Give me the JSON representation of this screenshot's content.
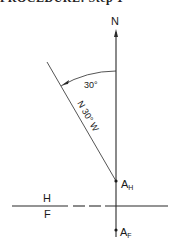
{
  "caption": "PROCEDURE: Step 1",
  "diagram": {
    "north_label": "N",
    "angle_label": "30°",
    "bearing_label": "N 30° W",
    "plane_top": "H",
    "plane_bottom": "F",
    "point_h_main": "A",
    "point_h_sub": "H",
    "point_f_main": "A",
    "point_f_sub": "F",
    "line_color": "#2a2a2a",
    "angle_deg": 30
  }
}
